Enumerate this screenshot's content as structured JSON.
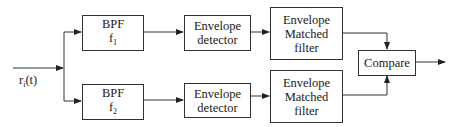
{
  "diagram": {
    "input": {
      "label": "r",
      "label_sub": "i",
      "label_suffix": "(t)"
    },
    "branches": [
      {
        "bpf": {
          "line1": "BPF",
          "line2": "f",
          "line2_sub": "1"
        },
        "detector": {
          "line1": "Envelope",
          "line2": "detector"
        },
        "matched_filter": {
          "line1": "Envelope",
          "line2": "Matched",
          "line3": "filter"
        }
      },
      {
        "bpf": {
          "line1": "BPF",
          "line2": "f",
          "line2_sub": "2"
        },
        "detector": {
          "line1": "Envelope",
          "line2": "detector"
        },
        "matched_filter": {
          "line1": "Envelope",
          "line2": "Matched",
          "line3": "filter"
        }
      }
    ],
    "compare": {
      "label": "Compare"
    },
    "colors": {
      "line": "#333333",
      "text": "#1a1a1a",
      "background": "#ffffff"
    }
  }
}
